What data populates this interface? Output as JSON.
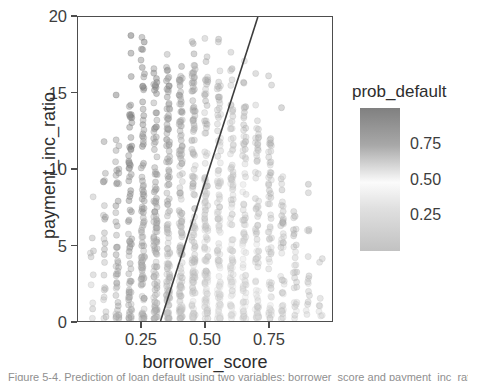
{
  "figure": {
    "caption": "Figure 5-4. Prediction of loan default using two variables: borrower_score and payment_inc_ratio."
  },
  "axes": {
    "x": {
      "title": "borrower_score",
      "ticks": [
        "0.25",
        "0.50",
        "0.75"
      ],
      "tick_values": [
        0.25,
        0.5,
        0.75
      ],
      "range": [
        0.0,
        1.0
      ]
    },
    "y": {
      "title": "payment_inc_ratio",
      "ticks": [
        "0",
        "5",
        "10",
        "15",
        "20"
      ],
      "tick_values": [
        0,
        5,
        10,
        15,
        20
      ],
      "range": [
        0,
        20
      ]
    }
  },
  "legend": {
    "title": "prob_default",
    "ticks": [
      "0.75",
      "0.50",
      "0.25"
    ],
    "tick_values": [
      0.75,
      0.5,
      0.25
    ],
    "range": [
      0.0,
      1.0
    ],
    "gradient_top_color": "#808080",
    "gradient_mid_color": "#fbfbfb",
    "gradient_bottom_color": "#c2c2c2"
  },
  "style": {
    "point_color": "#9a9a9a",
    "boundary_line_color": "#3c3c3c",
    "frame_color": "#4d4d4d",
    "background": "#ffffff"
  },
  "chart_data": {
    "type": "scatter",
    "title": "",
    "xlabel": "borrower_score",
    "ylabel": "payment_inc_ratio",
    "xlim": [
      0.0,
      1.0
    ],
    "ylim": [
      0,
      20
    ],
    "grid": false,
    "legend_position": "right",
    "color_label": "prob_default",
    "color_scale": "grayscale",
    "color_range": [
      0.0,
      1.0
    ],
    "x_ticks": [
      0.25,
      0.5,
      0.75
    ],
    "y_ticks": [
      0,
      5,
      10,
      15,
      20
    ],
    "note": "Points fall in discrete vertical bands at borrower_score values; marker shade encodes prob_default.",
    "bands": [
      {
        "x": 0.055,
        "n": 10,
        "y_max": 11.4,
        "y_dense_max": 6.0,
        "shade": 0.62
      },
      {
        "x": 0.105,
        "n": 24,
        "y_max": 14.9,
        "y_dense_max": 9.5,
        "shade": 0.68
      },
      {
        "x": 0.155,
        "n": 46,
        "y_max": 17.0,
        "y_dense_max": 12.0,
        "shade": 0.72
      },
      {
        "x": 0.205,
        "n": 72,
        "y_max": 19.2,
        "y_dense_max": 14.5,
        "shade": 0.74
      },
      {
        "x": 0.255,
        "n": 95,
        "y_max": 19.6,
        "y_dense_max": 16.2,
        "shade": 0.7
      },
      {
        "x": 0.305,
        "n": 110,
        "y_max": 19.3,
        "y_dense_max": 16.8,
        "shade": 0.64
      },
      {
        "x": 0.355,
        "n": 120,
        "y_max": 19.6,
        "y_dense_max": 17.0,
        "shade": 0.58
      },
      {
        "x": 0.405,
        "n": 126,
        "y_max": 19.2,
        "y_dense_max": 17.1,
        "shade": 0.52
      },
      {
        "x": 0.455,
        "n": 122,
        "y_max": 18.6,
        "y_dense_max": 16.6,
        "shade": 0.46
      },
      {
        "x": 0.505,
        "n": 118,
        "y_max": 19.1,
        "y_dense_max": 16.4,
        "shade": 0.4
      },
      {
        "x": 0.555,
        "n": 110,
        "y_max": 18.8,
        "y_dense_max": 15.8,
        "shade": 0.36
      },
      {
        "x": 0.605,
        "n": 100,
        "y_max": 18.1,
        "y_dense_max": 15.0,
        "shade": 0.34
      },
      {
        "x": 0.655,
        "n": 90,
        "y_max": 17.4,
        "y_dense_max": 14.2,
        "shade": 0.36
      },
      {
        "x": 0.705,
        "n": 78,
        "y_max": 16.9,
        "y_dense_max": 13.4,
        "shade": 0.4
      },
      {
        "x": 0.755,
        "n": 62,
        "y_max": 16.2,
        "y_dense_max": 12.0,
        "shade": 0.44
      },
      {
        "x": 0.805,
        "n": 44,
        "y_max": 14.4,
        "y_dense_max": 10.0,
        "shade": 0.48
      },
      {
        "x": 0.855,
        "n": 28,
        "y_max": 12.8,
        "y_dense_max": 8.0,
        "shade": 0.52
      },
      {
        "x": 0.905,
        "n": 16,
        "y_max": 10.4,
        "y_dense_max": 6.2,
        "shade": 0.54
      },
      {
        "x": 0.955,
        "n": 8,
        "y_max": 8.5,
        "y_dense_max": 4.5,
        "shade": 0.56
      }
    ],
    "decision_boundary": {
      "label": "decision boundary",
      "x_start": 0.325,
      "y_start": 0.0,
      "x_end": 0.708,
      "y_end": 20.0
    }
  }
}
